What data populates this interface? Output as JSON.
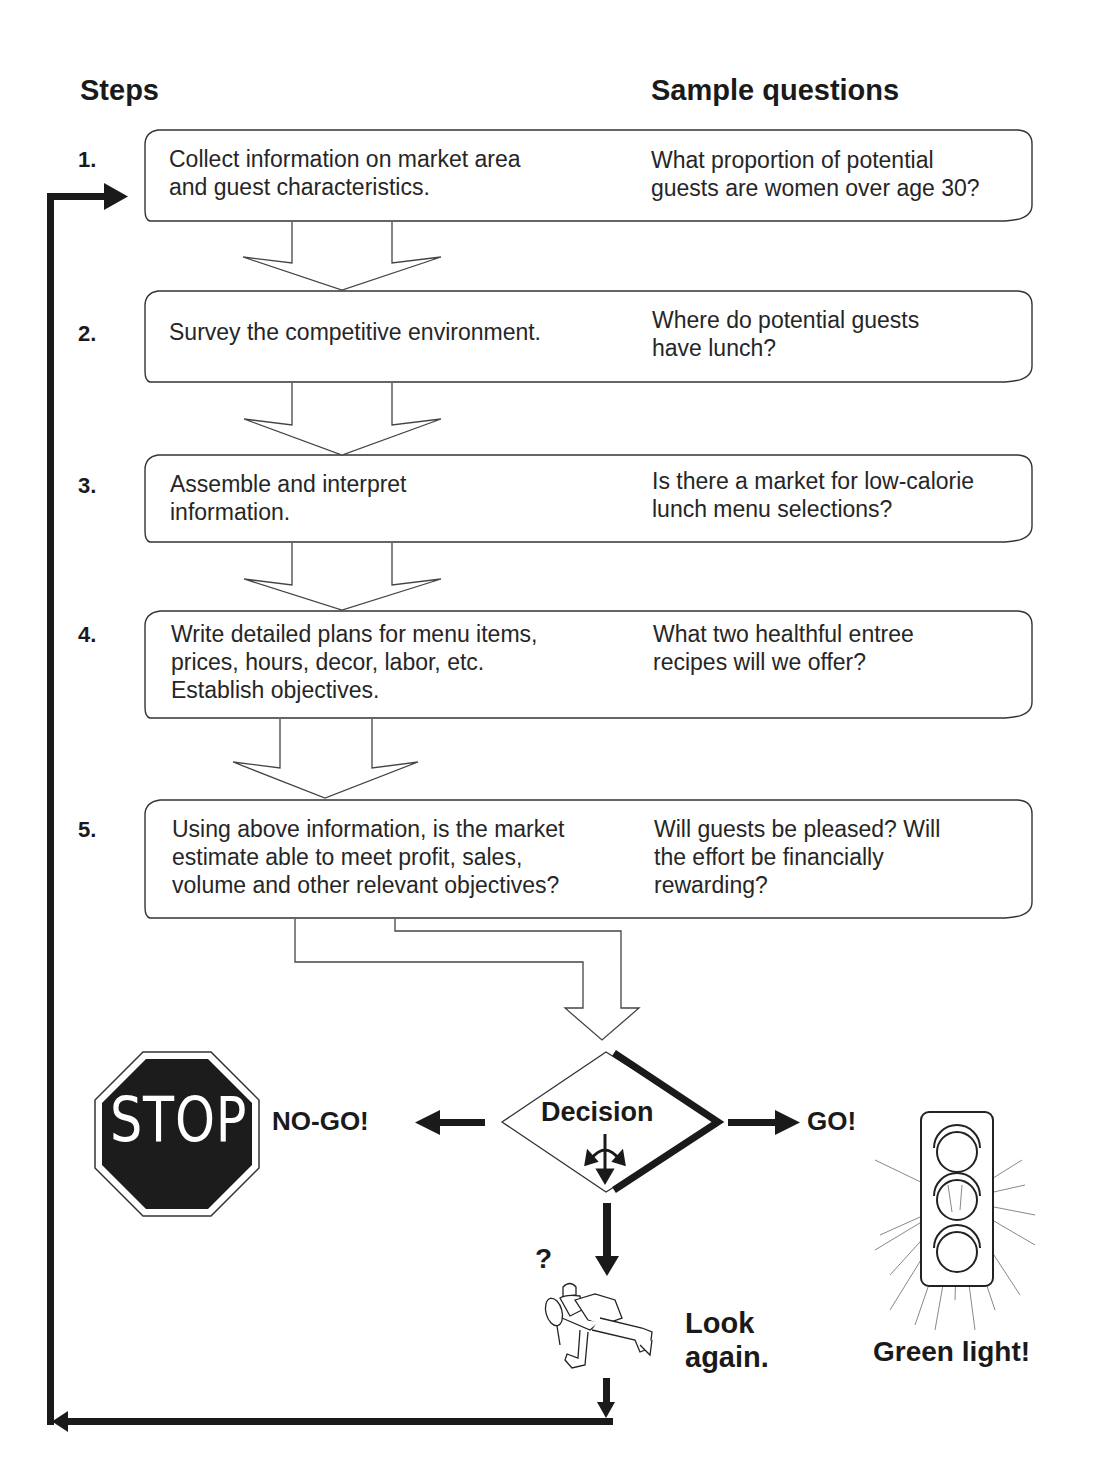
{
  "headers": {
    "steps": "Steps",
    "questions": "Sample questions"
  },
  "steps": [
    {
      "number": "1.",
      "text": "Collect information on market area\nand guest characteristics.",
      "question": "What proportion of potential\nguests are women over age 30?"
    },
    {
      "number": "2.",
      "text": "Survey the competitive environment.",
      "question": "Where do potential guests\nhave lunch?"
    },
    {
      "number": "3.",
      "text": "Assemble and interpret\ninformation.",
      "question": "Is there a market for low-calorie\nlunch menu selections?"
    },
    {
      "number": "4.",
      "text": "Write detailed plans for menu items,\nprices, hours, decor, labor, etc.\nEstablish objectives.",
      "question": "What two healthful entree\nrecipes will we offer?"
    },
    {
      "number": "5.",
      "text": "Using above information, is the market\nestimate able to meet profit, sales,\nvolume and other relevant objectives?",
      "question": "Will guests be pleased? Will\nthe effort be financially\nrewarding?"
    }
  ],
  "decision": {
    "label": "Decision",
    "icon": "three-way-arrow-icon"
  },
  "outcomes": {
    "stop_sign": "STOP",
    "no_go": "NO-GO!",
    "go": "GO!",
    "green_light": "Green light!",
    "question_mark": "?",
    "look_again_line1": "Look",
    "look_again_line2": "again."
  },
  "icons": {
    "stop": "stop-sign-icon",
    "traffic_light": "traffic-light-icon",
    "detective": "detective-magnifier-icon"
  }
}
